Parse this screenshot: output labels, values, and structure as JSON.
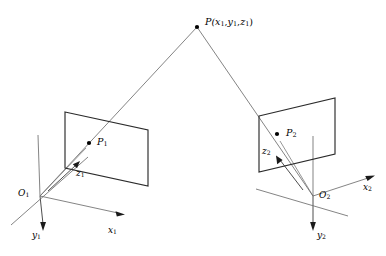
{
  "figure": {
    "name": "stereo-projection-geometry",
    "background_color": "#ffffff",
    "line_color": "#6e6e6e",
    "plane_edge_color": "#2b2b2b",
    "point_color": "#000000",
    "width": 386,
    "height": 256
  },
  "labels": {
    "scene_point": {
      "text": "P(x1,y1,z1)",
      "prefix": "P(",
      "components": [
        "x",
        "y",
        "z"
      ],
      "subscript": "1",
      "suffix": ")",
      "x": 205,
      "y": 18
    },
    "image_point_left": {
      "base": "P",
      "subscript": "1",
      "x": 97,
      "y": 138
    },
    "image_point_right": {
      "base": "P",
      "subscript": "2",
      "x": 286,
      "y": 129
    },
    "origin_left": {
      "base": "O",
      "subscript": "1",
      "x": 19,
      "y": 190
    },
    "origin_right": {
      "base": "O",
      "subscript": "2",
      "x": 319,
      "y": 192
    },
    "axis_x_left": {
      "base": "x",
      "subscript": "1",
      "x": 108,
      "y": 226
    },
    "axis_y_left": {
      "base": "y",
      "subscript": "1",
      "x": 33,
      "y": 231
    },
    "axis_z_left": {
      "base": "z",
      "subscript": "1",
      "x": 76,
      "y": 170
    },
    "axis_x_right": {
      "base": "x",
      "subscript": "2",
      "x": 363,
      "y": 184
    },
    "axis_y_right": {
      "base": "y",
      "subscript": "2",
      "x": 317,
      "y": 231
    },
    "axis_z_right": {
      "base": "z",
      "subscript": "2",
      "x": 263,
      "y": 148
    }
  },
  "geometry": {
    "scene_point_dot": {
      "x": 197,
      "y": 27,
      "r": 2.0
    },
    "left_plane": {
      "points": "65,112 148,130 148,186 65,168",
      "corners": [
        {
          "x": 65,
          "y": 112
        },
        {
          "x": 148,
          "y": 130
        },
        {
          "x": 148,
          "y": 186
        },
        {
          "x": 65,
          "y": 168
        }
      ]
    },
    "right_plane": {
      "points": "259,116 335,98 335,154 259,172",
      "corners": [
        {
          "x": 259,
          "y": 116
        },
        {
          "x": 335,
          "y": 98
        },
        {
          "x": 335,
          "y": 154
        },
        {
          "x": 259,
          "y": 172
        }
      ]
    },
    "left_image_point_dot": {
      "x": 89,
      "y": 143,
      "r": 2.0
    },
    "right_image_point_dot": {
      "x": 277,
      "y": 134,
      "r": 2.0
    },
    "origin_left_point": {
      "x": 40,
      "y": 196
    },
    "origin_right_point": {
      "x": 313,
      "y": 196
    },
    "ray_left": {
      "x1": 197,
      "y1": 27,
      "x2": 40,
      "y2": 196
    },
    "ray_right": {
      "x1": 197,
      "y1": 27,
      "x2": 313,
      "y2": 196
    },
    "left_axes": {
      "x_axis": {
        "x1": 40,
        "y1": 196,
        "x2": 124,
        "y2": 214
      },
      "y_axis": {
        "x1": 40,
        "y1": 196,
        "x2": 43,
        "y2": 229
      },
      "y_axis_up": {
        "x1": 40,
        "y1": 196,
        "x2": 37,
        "y2": 135
      },
      "diag_axis": {
        "x1": 86,
        "y1": 159,
        "x2": 12,
        "y2": 224
      }
    },
    "right_axes": {
      "x_axis": {
        "x1": 313,
        "y1": 196,
        "x2": 374,
        "y2": 176
      },
      "y_axis": {
        "x1": 313,
        "y1": 196,
        "x2": 313,
        "y2": 229
      },
      "y_axis_up": {
        "x1": 313,
        "y1": 196,
        "x2": 313,
        "y2": 136
      },
      "diag_axis": {
        "x1": 344,
        "y1": 214,
        "x2": 257,
        "y2": 190
      }
    },
    "z_arrow_left": {
      "x1": 50,
      "y1": 190,
      "x2": 79,
      "y2": 162
    },
    "z_arrow_right": {
      "x1": 302,
      "y1": 192,
      "x2": 276,
      "y2": 157
    }
  }
}
